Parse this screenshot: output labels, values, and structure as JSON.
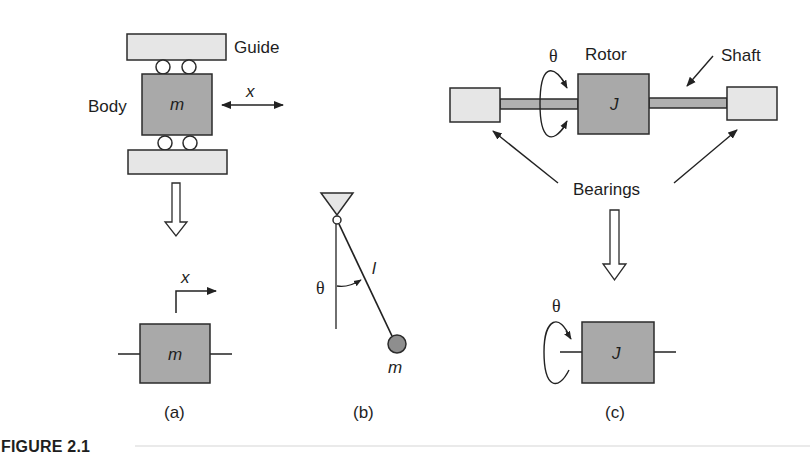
{
  "figure": {
    "label": "FIGURE 2.1",
    "colors": {
      "mass_fill": "#a9a9a9",
      "support_fill": "#e6e6e6",
      "shaft_fill": "#b0b0b0",
      "stroke": "#2b2b2b",
      "background": "#ffffff"
    }
  },
  "panel_a": {
    "caption": "(a)",
    "guide_label": "Guide",
    "body_label": "Body",
    "mass_symbol": "m",
    "displacement_symbol": "x",
    "model_mass_symbol": "m",
    "model_displacement_symbol": "x"
  },
  "panel_b": {
    "caption": "(b)",
    "angle_symbol": "θ",
    "length_symbol": "l",
    "mass_symbol": "m"
  },
  "panel_c": {
    "caption": "(c)",
    "angle_symbol": "θ",
    "rotor_label": "Rotor",
    "shaft_label": "Shaft",
    "bearings_label": "Bearings",
    "inertia_symbol": "J",
    "model_angle_symbol": "θ",
    "model_inertia_symbol": "J"
  }
}
